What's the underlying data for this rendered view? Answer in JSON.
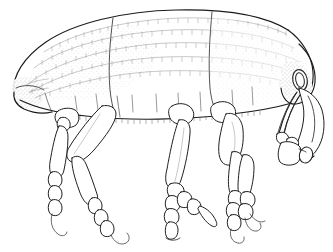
{
  "figure": {
    "title": "Weevil, lateral view",
    "view": "lateral (side) view, head to the right",
    "style": "black ink line drawing with stipple shading on white background",
    "caption": "",
    "width_px": 333,
    "height_px": 252
  },
  "colors": {
    "background": "#ffffff",
    "ink": "#1b1b1b",
    "ink_secondary": "#303030",
    "stria_gray": "#9a9a9a",
    "suture_gray": "#4a4a4a",
    "stipple_gray": "#7d7d7d",
    "shade_fill": "#f0f0f0"
  },
  "anatomy": {
    "parts": [
      {
        "id": "elytra",
        "label": "Elytra",
        "note": "large dorsal wing covers occupying left two thirds, bearing punctate striae"
      },
      {
        "id": "elytral-apex",
        "label": "Elytral apex",
        "note": "stippled rounded posterior tip at far left"
      },
      {
        "id": "pronotum",
        "label": "Pronotum",
        "note": "thorax shield between elytra and head, with dense punctures"
      },
      {
        "id": "head",
        "label": "Head",
        "note": "small stippled capsule bearing the eye at right"
      },
      {
        "id": "eye",
        "label": "Compound eye",
        "note": "vertical oval on side of head"
      },
      {
        "id": "rostrum",
        "label": "Rostrum",
        "note": "long downward curving snout at far right"
      },
      {
        "id": "antenna",
        "label": "Antenna",
        "note": "geniculate, with long scape, funicle and oval club"
      },
      {
        "id": "antennal-club",
        "label": "Antennal club",
        "note": "small oval terminal segment"
      },
      {
        "id": "venter",
        "label": "Ventrites",
        "note": "abdominal sternites along lower body margin with hair fringe"
      },
      {
        "id": "hind-leg",
        "label": "Hind leg",
        "note": "left pair: coxa, trochanter, thick femur, tibia, 3 tarsal segments, claw"
      },
      {
        "id": "middle-leg",
        "label": "Middle leg",
        "note": "central pair: slender femur and tibia, short tarsus"
      },
      {
        "id": "front-leg",
        "label": "Front leg",
        "note": "right pair: stout femur, long tibia, claw-bearing tarsus"
      },
      {
        "id": "tarsal-claw",
        "label": "Tarsal claw",
        "note": "hooked terminal claw on each tarsus"
      },
      {
        "id": "striae",
        "label": "Elytral striae",
        "note": "rows of fine punctures shown as tick marks along curved lines"
      }
    ],
    "leg_groups": [
      {
        "id": "hind-leg",
        "label": "Hind leg",
        "count": 2,
        "segments": [
          "coxa",
          "trochanter",
          "femur",
          "tibia",
          "tarsus",
          "claw"
        ]
      },
      {
        "id": "middle-leg",
        "label": "Middle leg",
        "count": 2,
        "segments": [
          "trochanter",
          "femur",
          "tibia",
          "tarsus",
          "claw"
        ]
      },
      {
        "id": "front-leg",
        "label": "Front leg",
        "count": 2,
        "segments": [
          "femur",
          "tibia",
          "tarsus",
          "claw"
        ]
      }
    ]
  },
  "annotations": {
    "labels": [],
    "scale_bar": "",
    "figure_number": ""
  }
}
